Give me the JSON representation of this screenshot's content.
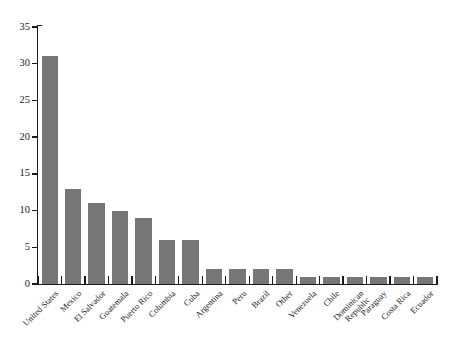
{
  "chart_data": {
    "type": "bar",
    "title": "",
    "subtitle": "",
    "xlabel": "",
    "ylabel": "",
    "ylim": [
      0,
      35
    ],
    "yticks": [
      0,
      5,
      10,
      15,
      20,
      25,
      30,
      35
    ],
    "grid": false,
    "legend": null,
    "bar_color": "#767676",
    "axis_color": "#1a1a1a",
    "background": "#ffffff",
    "categories": [
      "United States",
      "Mexico",
      "El Salvador",
      "Guatemala",
      "Puerto Rico",
      "Columbia",
      "Cuba",
      "Argentina",
      "Peru",
      "Brazil",
      "Other",
      "Venezuela",
      "Chile",
      "Dominican Republic",
      "Paraguay",
      "Costa Rica",
      "Ecuador"
    ],
    "values": [
      31,
      13,
      11,
      10,
      9,
      6,
      6,
      2,
      2,
      2,
      2,
      1,
      1,
      1,
      1,
      1,
      1
    ]
  }
}
